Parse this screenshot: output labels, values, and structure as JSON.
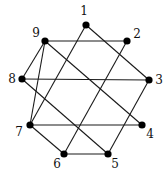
{
  "diagram": {
    "type": "graph",
    "nodes": [
      {
        "id": "1",
        "label": "1",
        "x": 86,
        "y": 25,
        "lx": 84,
        "ly": 11
      },
      {
        "id": "2",
        "label": "2",
        "x": 127,
        "y": 41,
        "lx": 137,
        "ly": 34
      },
      {
        "id": "3",
        "label": "3",
        "x": 149,
        "y": 80,
        "lx": 159,
        "ly": 80
      },
      {
        "id": "4",
        "label": "4",
        "x": 142,
        "y": 125,
        "lx": 150,
        "ly": 134
      },
      {
        "id": "5",
        "label": "5",
        "x": 108,
        "y": 154,
        "lx": 115,
        "ly": 164
      },
      {
        "id": "6",
        "label": "6",
        "x": 64,
        "y": 154,
        "lx": 57,
        "ly": 164
      },
      {
        "id": "7",
        "label": "7",
        "x": 30,
        "y": 125,
        "lx": 19,
        "ly": 132
      },
      {
        "id": "8",
        "label": "8",
        "x": 22,
        "y": 79,
        "lx": 12,
        "ly": 79
      },
      {
        "id": "9",
        "label": "9",
        "x": 45,
        "y": 41,
        "lx": 36,
        "ly": 33
      }
    ],
    "edges": [
      [
        "1",
        "3"
      ],
      [
        "1",
        "7"
      ],
      [
        "2",
        "9"
      ],
      [
        "2",
        "6"
      ],
      [
        "3",
        "8"
      ],
      [
        "3",
        "5"
      ],
      [
        "4",
        "9"
      ],
      [
        "4",
        "7"
      ],
      [
        "5",
        "8"
      ],
      [
        "5",
        "6"
      ],
      [
        "6",
        "7"
      ],
      [
        "7",
        "9"
      ],
      [
        "8",
        "9"
      ]
    ],
    "colors": {
      "node": "#000000",
      "edge": "#1a1a1a",
      "background": "#ffffff"
    }
  }
}
